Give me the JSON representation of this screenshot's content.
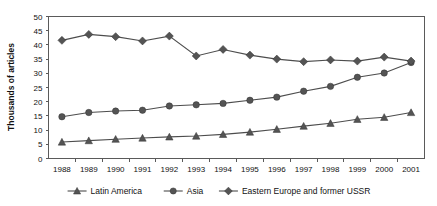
{
  "chart_data": {
    "type": "line",
    "title": "",
    "xlabel": "",
    "ylabel": "Thousands of articles",
    "categories": [
      "1988",
      "1989",
      "1990",
      "1991",
      "1992",
      "1993",
      "1994",
      "1995",
      "1996",
      "1997",
      "1998",
      "1999",
      "2000",
      "2001"
    ],
    "x": [
      1988,
      1989,
      1990,
      1991,
      1992,
      1993,
      1994,
      1995,
      1996,
      1997,
      1998,
      1999,
      2000,
      2001
    ],
    "ylim": [
      0,
      50
    ],
    "ytick_step": 5,
    "yticks": [
      0,
      5,
      10,
      15,
      20,
      25,
      30,
      35,
      40,
      45,
      50
    ],
    "grid": false,
    "legend_position": "bottom",
    "series": [
      {
        "name": "Latin America",
        "marker": "triangle",
        "color": "#545454",
        "values": [
          5.8,
          6.3,
          6.8,
          7.2,
          7.6,
          7.9,
          8.5,
          9.3,
          10.3,
          11.4,
          12.4,
          13.8,
          14.5,
          16.2
        ]
      },
      {
        "name": "Asia",
        "marker": "circle",
        "color": "#545454",
        "values": [
          14.7,
          16.2,
          16.7,
          17.0,
          18.5,
          18.9,
          19.4,
          20.5,
          21.6,
          23.7,
          25.4,
          28.6,
          30.1,
          33.8
        ]
      },
      {
        "name": "Eastern Europe and former USSR",
        "marker": "diamond",
        "color": "#545454",
        "values": [
          41.6,
          43.7,
          42.9,
          41.4,
          43.1,
          36.1,
          38.4,
          36.4,
          35.0,
          34.1,
          34.7,
          34.3,
          35.7,
          34.3
        ]
      }
    ]
  },
  "axes": {
    "y_axis_label": "Thousands of articles",
    "y_tick_labels": [
      "50",
      "45",
      "40",
      "35",
      "30",
      "25",
      "20",
      "15",
      "10",
      "5",
      "0"
    ],
    "x_tick_labels": [
      "1988",
      "1989",
      "1990",
      "1991",
      "1992",
      "1993",
      "1994",
      "1995",
      "1996",
      "1997",
      "1998",
      "1999",
      "2000",
      "2001"
    ]
  },
  "legend": {
    "items": [
      {
        "label": "Latin America",
        "marker": "triangle-icon"
      },
      {
        "label": "Asia",
        "marker": "circle-icon"
      },
      {
        "label": "Eastern Europe and former USSR",
        "marker": "diamond-icon"
      }
    ]
  },
  "colors": {
    "series_stroke": "#4d4d4d",
    "marker_fill": "#545454",
    "frame": "#5a5a5a",
    "text": "#111111",
    "background": "#ffffff"
  }
}
